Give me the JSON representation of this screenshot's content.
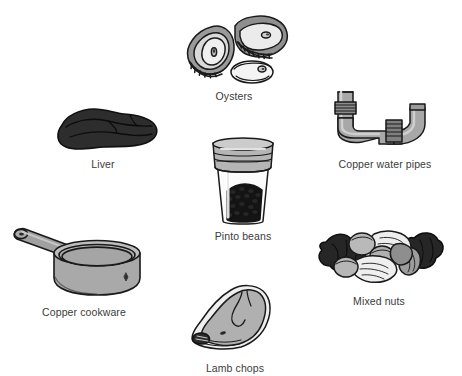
{
  "figure": {
    "background_color": "#ffffff",
    "label_color": "#3b3b3b",
    "title": "",
    "items": [
      {
        "id": "oysters",
        "label": "Oysters",
        "icon": "oysters-icon",
        "description": "Three oysters: two in rough shells and one shucked on the half shell",
        "colors": {
          "outline": "#1a1a1a",
          "shell_dark": "#8f8f8f",
          "shell_mid": "#b8b8b8",
          "shell_light": "#dcdcdc",
          "flesh": "#f2f2f2"
        }
      },
      {
        "id": "liver",
        "label": "Liver",
        "icon": "liver-icon",
        "description": "A dark lobed slab of liver",
        "colors": {
          "outline": "#111111",
          "body": "#2d2d2d",
          "shade": "#1d1d1d"
        }
      },
      {
        "id": "copper-water-pipes",
        "label": "Copper water pipes",
        "icon": "copper-pipe-icon",
        "description": "A Z-bent length of pipe with two threaded couplings",
        "colors": {
          "outline": "#1a1a1a",
          "pipe": "#a3a3a3",
          "pipe_light": "#c0c0c0",
          "coupling": "#8a8a8a"
        }
      },
      {
        "id": "pinto-beans",
        "label": "Pinto beans",
        "icon": "bean-jar-icon",
        "description": "A clear jar with a screw lid, half filled with dark beans",
        "colors": {
          "outline": "#1a1a1a",
          "lid": "#b5b5b5",
          "glass": "#fbfbfb",
          "beans": "#161616"
        }
      },
      {
        "id": "copper-cookware",
        "label": "Copper cookware",
        "icon": "saucepan-icon",
        "description": "A saucepan with a long handle having a hanging hole",
        "colors": {
          "outline": "#1a1a1a",
          "body": "#a9a9a9",
          "rim": "#c2c2c2",
          "handle": "#a0a0a0"
        }
      },
      {
        "id": "mixed-nuts",
        "label": "Mixed nuts",
        "icon": "mixed-nuts-icon",
        "description": "A heap of nuts: dark walnuts, light pecans, almonds and hazelnuts",
        "colors": {
          "outline": "#1a1a1a",
          "walnut": "#262626",
          "pecan": "#ededed",
          "almond": "#9d9d9d",
          "hazelnut": "#b9b9b9"
        }
      },
      {
        "id": "lamb-chops",
        "label": "Lamb chops",
        "icon": "lamb-chop-icon",
        "description": "A loin lamb chop seen from the side",
        "colors": {
          "outline": "#1a1a1a",
          "meat": "#b0b0b0",
          "fat": "#f0f0f0",
          "bone": "#2a2a2a"
        }
      }
    ]
  }
}
